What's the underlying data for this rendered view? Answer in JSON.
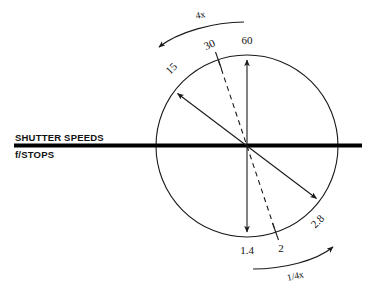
{
  "diagram": {
    "axis_labels": {
      "top": "SHUTTER SPEEDS",
      "bottom": "f/STOPS"
    },
    "shutter_speed_values": [
      {
        "label": "15",
        "angle_deg": 145,
        "rotation_deg": -45,
        "style": "solid-arrow"
      },
      {
        "label": "30",
        "angle_deg": 115,
        "rotation_deg": -25,
        "style": "dashed"
      },
      {
        "label": "60",
        "angle_deg": 90,
        "rotation_deg": 0,
        "style": "solid-arrow"
      }
    ],
    "fstop_values": [
      {
        "label": "1.4",
        "angle_deg": 270,
        "rotation_deg": 0,
        "style": "solid-arrow"
      },
      {
        "label": "2",
        "angle_deg": 295,
        "rotation_deg": 0,
        "style": "dashed"
      },
      {
        "label": "2.8",
        "angle_deg": 325,
        "rotation_deg": -45,
        "style": "solid-arrow"
      }
    ],
    "rotation_arrows": [
      {
        "label": "4x",
        "direction": "counterclockwise",
        "position": "top-left"
      },
      {
        "label": "1/4x",
        "direction": "clockwise",
        "position": "bottom-right"
      }
    ],
    "geometry": {
      "center_x": 247,
      "center_y": 146,
      "radius": 91,
      "axis_line_start_x": 14,
      "axis_line_end_x": 362
    },
    "colors": {
      "ink": "#111111",
      "line": "#1a1a1a",
      "background": "#ffffff"
    }
  }
}
